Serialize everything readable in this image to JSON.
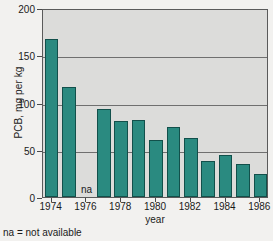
{
  "chart_data": {
    "type": "bar",
    "title": "",
    "xlabel": "year",
    "ylabel": "PCB, mg per kg",
    "categories": [
      1974,
      1975,
      1976,
      1977,
      1978,
      1979,
      1980,
      1981,
      1982,
      1983,
      1984,
      1985,
      1986
    ],
    "values": [
      167,
      116,
      null,
      93,
      80,
      81,
      60,
      74,
      62,
      38,
      44,
      35,
      24
    ],
    "missing_labels": {
      "1976": "na"
    },
    "ylim": [
      0,
      200
    ],
    "yticks": [
      0,
      50,
      100,
      150,
      200
    ],
    "ytick_labels": [
      "0",
      "50",
      "100",
      "150",
      "200"
    ],
    "xticks": [
      1974,
      1976,
      1978,
      1980,
      1982,
      1984,
      1986
    ],
    "xtick_labels": [
      "1974",
      "1976",
      "1978",
      "1980",
      "1982",
      "1984",
      "1986"
    ],
    "grid": true,
    "legend": false,
    "bar_color": "#2a8a80",
    "bar_edge_color": "#12504b",
    "plot_background": "#dcdcda",
    "page_background": "#f2f1ef"
  },
  "footnote": {
    "text": "na = not available"
  }
}
